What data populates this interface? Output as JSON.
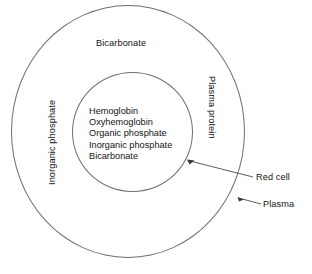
{
  "diagram": {
    "background_color": "#ffffff",
    "line_color": "#6e6e6e",
    "text_color": "#141414",
    "outer_region": {
      "name": "Plasma",
      "top_label": "Bicarbonate",
      "left_label": "Inorganic phosphate",
      "right_label": "Plasma protein"
    },
    "inner_region": {
      "name": "Red cell",
      "items": [
        "Hemoglobin",
        "Oxyhemoglobin",
        "Organic phosphate",
        "Inorganic phosphate",
        "Bicarbonate"
      ]
    },
    "callouts": [
      {
        "label": "Red cell",
        "points_to": "inner-circle"
      },
      {
        "label": "Plasma",
        "points_to": "outer-circle"
      }
    ]
  }
}
